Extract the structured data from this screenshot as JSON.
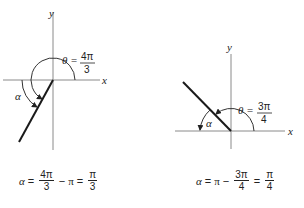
{
  "diagrams": [
    {
      "id": "left",
      "axis_labels": {
        "x": "x",
        "y": "y"
      },
      "theta_label": "θ =",
      "theta_value": {
        "numerator": "4π",
        "denominator": "3"
      },
      "alpha_label": "α",
      "equation": {
        "lhs": "α",
        "eq1": "=",
        "frac1": {
          "numerator": "4π",
          "denominator": "3"
        },
        "op": "−",
        "term": "π",
        "eq2": "=",
        "frac2": {
          "numerator": "π",
          "denominator": "3"
        }
      }
    },
    {
      "id": "right",
      "axis_labels": {
        "x": "x",
        "y": "y"
      },
      "theta_label": "θ =",
      "theta_value": {
        "numerator": "3π",
        "denominator": "4"
      },
      "alpha_label": "α",
      "equation": {
        "lhs": "α",
        "eq1": "=",
        "term": "π",
        "op": "−",
        "frac1": {
          "numerator": "3π",
          "denominator": "4"
        },
        "eq2": "=",
        "frac2": {
          "numerator": "π",
          "denominator": "4"
        }
      }
    }
  ],
  "colors": {
    "axis": "#8a8a8a",
    "ray": "#1a1a1a",
    "arc": "#333333"
  }
}
